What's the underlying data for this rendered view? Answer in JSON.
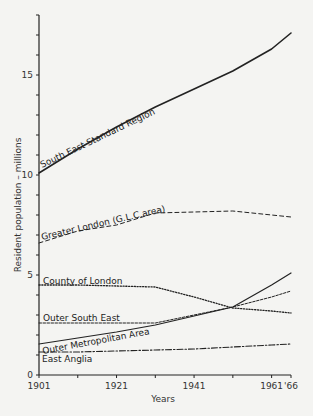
{
  "chart_data": {
    "type": "line",
    "title": "",
    "xlabel": "Years",
    "ylabel": "Resident population – millions",
    "x": [
      1901,
      1911,
      1921,
      1931,
      1941,
      1951,
      1961,
      1966
    ],
    "xticks": [
      {
        "value": 1901,
        "label": "1901"
      },
      {
        "value": 1911,
        "label": ""
      },
      {
        "value": 1921,
        "label": "1921"
      },
      {
        "value": 1931,
        "label": ""
      },
      {
        "value": 1941,
        "label": "1941"
      },
      {
        "value": 1951,
        "label": ""
      },
      {
        "value": 1961,
        "label": "1961"
      },
      {
        "value": 1966,
        "label": "'66"
      }
    ],
    "yticks": [
      {
        "value": 0,
        "label": "0"
      },
      {
        "value": 1,
        "label": ""
      },
      {
        "value": 2,
        "label": ""
      },
      {
        "value": 3,
        "label": ""
      },
      {
        "value": 4,
        "label": ""
      },
      {
        "value": 5,
        "label": "5"
      },
      {
        "value": 6,
        "label": ""
      },
      {
        "value": 7,
        "label": ""
      },
      {
        "value": 8,
        "label": ""
      },
      {
        "value": 9,
        "label": ""
      },
      {
        "value": 10,
        "label": "10"
      },
      {
        "value": 11,
        "label": ""
      },
      {
        "value": 12,
        "label": ""
      },
      {
        "value": 13,
        "label": ""
      },
      {
        "value": 14,
        "label": ""
      },
      {
        "value": 15,
        "label": "15"
      },
      {
        "value": 16,
        "label": ""
      },
      {
        "value": 17,
        "label": ""
      },
      {
        "value": 18,
        "label": ""
      }
    ],
    "xlim": [
      1901,
      1966
    ],
    "ylim": [
      0,
      18
    ],
    "grid": false,
    "legend": "inline labels",
    "series": [
      {
        "name": "South East Standard Region",
        "style": "solid",
        "width": 1.6,
        "values": [
          10.1,
          11.3,
          12.4,
          13.4,
          14.3,
          15.2,
          16.3,
          17.1
        ],
        "label_pos": {
          "x": 42,
          "y": 168,
          "angle": -25.5
        }
      },
      {
        "name": "Greater London (G.L.C.area)",
        "style": "dashed",
        "width": 1,
        "values": [
          6.6,
          7.2,
          7.5,
          8.1,
          8.15,
          8.2,
          8.0,
          7.9
        ],
        "label_pos": {
          "x": 42,
          "y": 240,
          "angle": -13
        }
      },
      {
        "name": "County of London",
        "style": "dotted",
        "width": 1.3,
        "values": [
          4.5,
          4.5,
          4.45,
          4.4,
          3.9,
          3.35,
          3.2,
          3.1
        ],
        "label_pos": {
          "x": 43,
          "y": 284,
          "angle": 0
        }
      },
      {
        "name": "Outer South East",
        "style": "dashed-fine",
        "width": 1,
        "values": [
          2.6,
          2.6,
          2.6,
          2.6,
          3.0,
          3.4,
          3.9,
          4.2
        ],
        "label_pos": {
          "x": 43,
          "y": 321,
          "angle": 0
        }
      },
      {
        "name": "Outer Metropolitan Area",
        "style": "solid",
        "width": 1.2,
        "values": [
          1.55,
          1.85,
          2.15,
          2.5,
          2.95,
          3.4,
          4.5,
          5.1
        ],
        "label_pos": {
          "x": 43,
          "y": 354,
          "angle": -10.5
        }
      },
      {
        "name": "East Anglia",
        "style": "dash-dot",
        "width": 1.1,
        "values": [
          1.15,
          1.15,
          1.2,
          1.25,
          1.3,
          1.4,
          1.5,
          1.55
        ],
        "label_pos": {
          "x": 42,
          "y": 362,
          "angle": 0
        }
      }
    ]
  },
  "colors": {
    "background": "#f4f4f2",
    "ink": "#222222"
  }
}
